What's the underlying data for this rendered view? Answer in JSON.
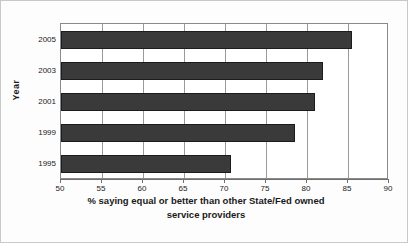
{
  "chart_data": {
    "type": "bar",
    "orientation": "horizontal",
    "title": "",
    "xlabel": "% saying equal or better than other State/Fed owned service providers",
    "xlabel_lines": [
      "% saying equal or better than other State/Fed owned",
      "service providers"
    ],
    "ylabel": "Year",
    "categories": [
      "2005",
      "2003",
      "2001",
      "1999",
      "1995"
    ],
    "values": [
      85.5,
      82.0,
      81.0,
      78.5,
      70.7
    ],
    "xlim": [
      50,
      90
    ],
    "xticks": [
      50,
      55,
      60,
      65,
      70,
      75,
      80,
      85,
      90
    ],
    "xtick_labels": [
      "50",
      "55",
      "60",
      "65",
      "70",
      "75",
      "80",
      "85",
      "90"
    ],
    "grid": true,
    "grid_axis": "x",
    "legend": false,
    "legend_position": "none",
    "bar_color": "#3a3a3a",
    "bar_edge_color": "#1c1c1c",
    "gridline_color": "#9a9a9a",
    "axis_color": "#6f6f6f",
    "plot_background": "#ffffff",
    "figure_background": "#fdfdfd",
    "frame_border_color": "#c9c9c9"
  }
}
